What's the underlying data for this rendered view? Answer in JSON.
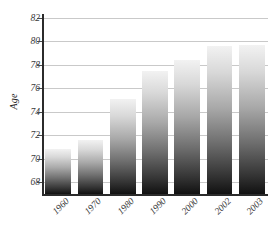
{
  "chart_data": {
    "type": "bar",
    "title": "",
    "xlabel": "",
    "ylabel": "Age",
    "categories": [
      "1960",
      "1970",
      "1980",
      "1990",
      "2000",
      "2002",
      "2003"
    ],
    "values": [
      70.8,
      71.6,
      75.1,
      77.5,
      78.4,
      79.6,
      79.7
    ],
    "ylim": [
      67,
      82
    ],
    "yticks": [
      68,
      70,
      72,
      74,
      76,
      78,
      80,
      82
    ],
    "ytick_labels": [
      "68",
      "70",
      "72",
      "74",
      "76",
      "78",
      "80",
      "82"
    ],
    "grid": true,
    "legend": "none",
    "series": [
      {
        "name": "Age",
        "values": [
          70.8,
          71.6,
          75.1,
          77.5,
          78.4,
          79.6,
          79.7
        ]
      }
    ],
    "colors": {
      "bar_top": "#f2f2f2",
      "bar_bottom": "#111111",
      "gridline": "#c9c9c9",
      "axis": "#2b2b2b",
      "text": "#3a3a3a",
      "background": "#ffffff"
    }
  }
}
